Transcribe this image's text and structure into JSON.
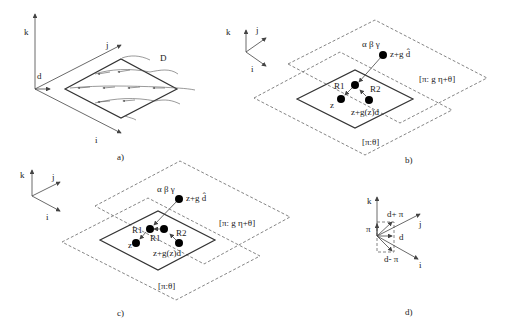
{
  "figure": {
    "panels": [
      {
        "id": "a",
        "caption": "a)",
        "axes": {
          "k": "k",
          "j": "j",
          "i": "i"
        },
        "labels": {
          "d": "d",
          "D": "D"
        }
      },
      {
        "id": "b",
        "caption": "b)",
        "axes": {
          "k": "k",
          "j": "j",
          "i": "i"
        },
        "labels": {
          "greek": "α β γ",
          "top_point": "z+g d̂",
          "upper_plane": "[π: g η+θ]",
          "lower_plane": "[π:θ]",
          "R1": "R1",
          "R2": "R2",
          "z": "z",
          "z_plus": "z+g(z)d"
        }
      },
      {
        "id": "c",
        "caption": "c)",
        "axes": {
          "k": "k",
          "j": "j",
          "i": "i"
        },
        "labels": {
          "greek": "α β γ",
          "top_point": "z+g d̂",
          "upper_plane": "[π: g η+θ]",
          "lower_plane": "[π:θ]",
          "R1a": "R1",
          "R1b": "R1",
          "R2": "R2",
          "z": "z",
          "z_plus": "z+g(z)d"
        }
      },
      {
        "id": "d",
        "caption": "d)",
        "axes": {
          "k": "k",
          "j": "j",
          "i": "i"
        },
        "labels": {
          "pi": "π",
          "d_plus": "d+ π",
          "d": "d",
          "d_minus": "d- π"
        }
      }
    ]
  }
}
